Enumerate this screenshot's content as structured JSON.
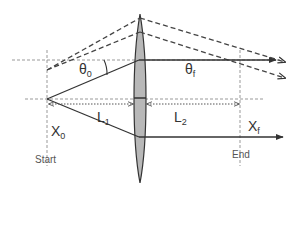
{
  "diagram": {
    "type": "thin-lens ray diagram",
    "colors": {
      "line": "#333333",
      "dashed": "#444444",
      "guide": "#999999",
      "lens_fill": "#b8b8b8",
      "lens_stroke": "#333333"
    },
    "labels": {
      "theta0": {
        "base": "θ",
        "sub": "0"
      },
      "thetaf": {
        "base": "θ",
        "sub": "f"
      },
      "L1": {
        "base": "L",
        "sub": "1"
      },
      "L2": {
        "base": "L",
        "sub": "2"
      },
      "X0": {
        "base": "X",
        "sub": "0"
      },
      "Xf": {
        "base": "X",
        "sub": "f"
      },
      "start": "Start",
      "end": "End"
    }
  }
}
